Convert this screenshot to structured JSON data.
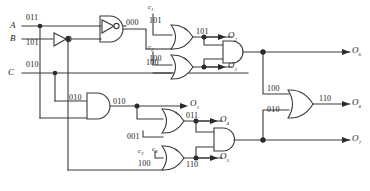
{
  "diagram": {
    "wire_color": "#3a3a3a",
    "text_color": "#1a1a1a"
  },
  "inputs": [
    {
      "name": "A",
      "value": "011"
    },
    {
      "name": "B",
      "value": "101"
    },
    {
      "name": "C",
      "value": "010"
    }
  ],
  "constants": [
    {
      "name": "c",
      "index": "1",
      "value": "101"
    },
    {
      "name": "c",
      "index": "2",
      "value": "100"
    },
    {
      "name": "c",
      "index": "3",
      "value": "001"
    },
    {
      "name": "c",
      "index": "4",
      "value": "100"
    }
  ],
  "wire_values": {
    "and1_out": "000",
    "or1_out": "101",
    "or2_out": "100",
    "and2_in_top": "010",
    "and2_out": "010",
    "c3_value": "001",
    "c4_value": "100",
    "or3_out": "011",
    "or4_out": "110",
    "o6_branch": "100",
    "o7_branch": "010",
    "or5_out": "110"
  },
  "outputs": [
    {
      "name": "O",
      "index": "1"
    },
    {
      "name": "O",
      "index": "2"
    },
    {
      "name": "O",
      "index": "3"
    },
    {
      "name": "O",
      "index": "4"
    },
    {
      "name": "O",
      "index": "5"
    },
    {
      "name": "O",
      "index": "6"
    },
    {
      "name": "O",
      "index": "7"
    },
    {
      "name": "O",
      "index": "8"
    }
  ],
  "gates": [
    {
      "id": "and1",
      "type": "AND"
    },
    {
      "id": "or1",
      "type": "OR"
    },
    {
      "id": "or2",
      "type": "OR"
    },
    {
      "id": "and3",
      "type": "AND"
    },
    {
      "id": "and2",
      "type": "AND"
    },
    {
      "id": "or3",
      "type": "OR"
    },
    {
      "id": "or4",
      "type": "OR"
    },
    {
      "id": "and4",
      "type": "AND"
    },
    {
      "id": "or5",
      "type": "OR"
    },
    {
      "id": "inv1",
      "type": "NOT"
    },
    {
      "id": "inv2",
      "type": "NOT"
    }
  ]
}
